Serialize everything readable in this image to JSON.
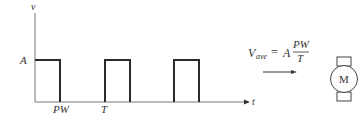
{
  "diagram": {
    "axes": {
      "y_label": "v",
      "x_label": "t",
      "amplitude_label": "A"
    },
    "ticks": {
      "pulse_width": "PW",
      "period": "T"
    },
    "formula": {
      "lhs_symbol": "V",
      "lhs_subscript": "ave",
      "equals": "=",
      "coefficient": "A",
      "numerator": "PW",
      "denominator": "T"
    },
    "motor": {
      "label": "M"
    },
    "colors": {
      "line": "#333333",
      "waveform": "#2a2a2a",
      "background": "#ffffff"
    }
  }
}
